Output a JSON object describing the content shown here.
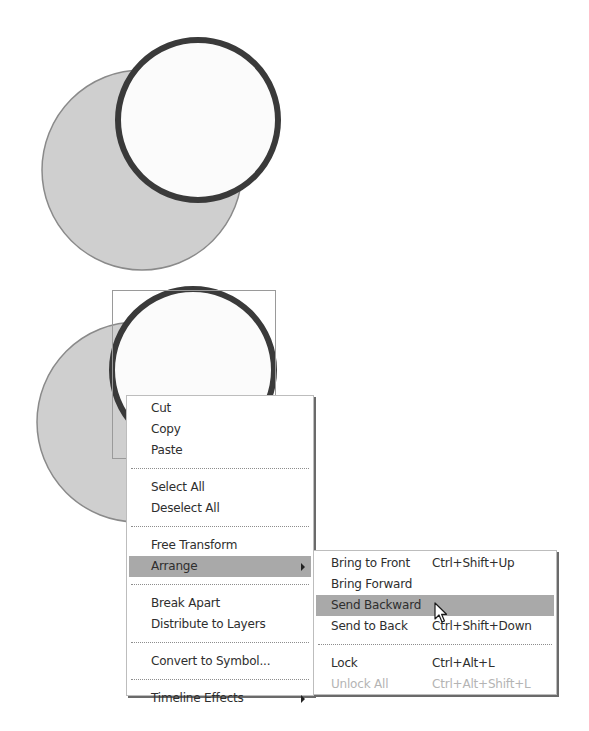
{
  "canvas": {
    "top_figure": {
      "gray_circle": {
        "cx": 142,
        "cy": 170,
        "r": 100
      },
      "white_circle": {
        "cx": 198,
        "cy": 120,
        "r": 80
      }
    },
    "bottom_figure": {
      "gray_circle": {
        "cx": 137,
        "cy": 422,
        "r": 100
      },
      "white_circle": {
        "cx": 193,
        "cy": 370,
        "r": 81
      },
      "selection_box": {
        "x": 112,
        "y": 290,
        "width": 163,
        "height": 168
      }
    },
    "colors": {
      "gray_fill": "#cfcfcf",
      "gray_stroke": "#8a8a8a",
      "white_fill": "#fbfbfb",
      "white_stroke": "#3a3a3a",
      "selection_stroke": "#9a9a9a",
      "menu_highlight": "#a9a9a9",
      "disabled_text": "#b4b4b4"
    }
  },
  "context_menu": {
    "groups": [
      [
        {
          "label": "Cut"
        },
        {
          "label": "Copy"
        },
        {
          "label": "Paste"
        }
      ],
      [
        {
          "label": "Select All"
        },
        {
          "label": "Deselect All"
        }
      ],
      [
        {
          "label": "Free Transform"
        },
        {
          "label": "Arrange",
          "submenu": true,
          "highlighted": true
        }
      ],
      [
        {
          "label": "Break Apart"
        },
        {
          "label": "Distribute to Layers"
        }
      ],
      [
        {
          "label": "Convert to Symbol..."
        }
      ],
      [
        {
          "label": "Timeline Effects",
          "submenu": true
        }
      ]
    ]
  },
  "arrange_submenu": {
    "groups": [
      [
        {
          "label": "Bring to Front",
          "shortcut": "Ctrl+Shift+Up"
        },
        {
          "label": "Bring Forward",
          "shortcut": ""
        },
        {
          "label": "Send Backward",
          "shortcut": "",
          "highlighted": true
        },
        {
          "label": "Send to Back",
          "shortcut": "Ctrl+Shift+Down"
        }
      ],
      [
        {
          "label": "Lock",
          "shortcut": "Ctrl+Alt+L"
        },
        {
          "label": "Unlock All",
          "shortcut": "Ctrl+Alt+Shift+L",
          "disabled": true
        }
      ]
    ]
  },
  "pointer": {
    "icon": "arrow-cursor-icon",
    "x": 434,
    "y": 602
  }
}
